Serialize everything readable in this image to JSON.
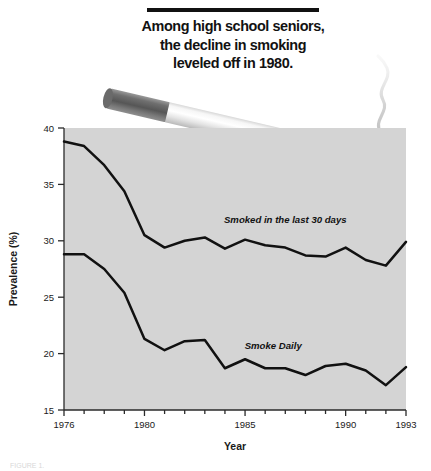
{
  "title": {
    "lines": [
      "Among high school seniors,",
      "the decline in smoking",
      "leveled off in 1980."
    ]
  },
  "graphic": {
    "cigarette_name": "cigarette-illustration",
    "smoke_name": "smoke-wisp",
    "filter_color": "#7d7d7d",
    "body_color": "#f2f2f2",
    "ember_color": "#4a4a4a"
  },
  "caption": {
    "text": "FIGURE 1."
  },
  "chart_data": {
    "type": "line",
    "title": "Among high school seniors, the decline in smoking leveled off in 1980.",
    "xlabel": "Year",
    "ylabel": "Prevalence (%)",
    "xlim": [
      1976,
      1993
    ],
    "ylim": [
      15,
      40
    ],
    "yticks": [
      15,
      20,
      25,
      30,
      35,
      40
    ],
    "xticks_major": [
      1976,
      1980,
      1985,
      1990,
      1993
    ],
    "xticks_minor": [
      1977,
      1978,
      1979,
      1981,
      1982,
      1983,
      1984,
      1986,
      1987,
      1988,
      1989,
      1991,
      1992
    ],
    "grid": false,
    "legend_position": "inline-annotation",
    "plot_background": "#d4d4d4",
    "line_color": "#111111",
    "x": [
      1976,
      1977,
      1978,
      1979,
      1980,
      1981,
      1982,
      1983,
      1984,
      1985,
      1986,
      1987,
      1988,
      1989,
      1990,
      1991,
      1992,
      1993
    ],
    "series": [
      {
        "name": "Smoked in the last 30 days",
        "values": [
          38.8,
          38.4,
          36.7,
          34.4,
          30.5,
          29.4,
          30.0,
          30.3,
          29.3,
          30.1,
          29.6,
          29.4,
          28.7,
          28.6,
          29.4,
          28.3,
          27.8,
          29.9
        ]
      },
      {
        "name": "Smoke Daily",
        "values": [
          28.8,
          28.8,
          27.5,
          25.4,
          21.3,
          20.3,
          21.1,
          21.2,
          18.7,
          19.5,
          18.7,
          18.7,
          18.1,
          18.9,
          19.1,
          18.5,
          17.2,
          18.8
        ]
      }
    ],
    "annotations": [
      {
        "label": "Smoked in the last 30 days",
        "x": 1987.0,
        "y": 31.6
      },
      {
        "label": "Smoke Daily",
        "x": 1986.4,
        "y": 20.4
      }
    ]
  }
}
